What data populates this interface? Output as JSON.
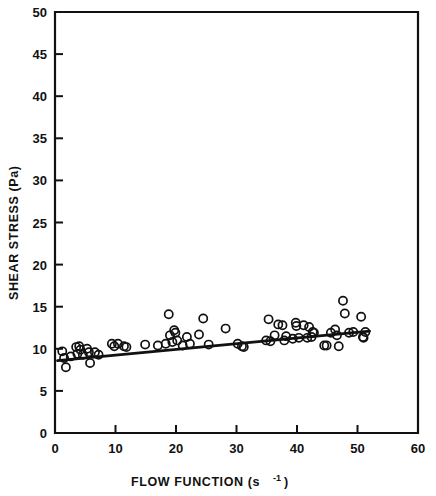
{
  "chart_data": {
    "type": "scatter",
    "title": "",
    "xlabel": "FLOW FUNCTION (s⁻¹)",
    "xlabel_base": "FLOW FUNCTION (s",
    "xlabel_exponent": "-1",
    "xlabel_suffix": ")",
    "ylabel": "SHEAR STRESS (Pa)",
    "xlim": [
      0,
      60
    ],
    "ylim": [
      0,
      50
    ],
    "xticks": [
      0,
      10,
      20,
      30,
      40,
      50,
      60
    ],
    "xtick_labels": [
      "0",
      "10",
      "20",
      "30",
      "40",
      "50",
      "60"
    ],
    "yticks": [
      0,
      5,
      10,
      15,
      20,
      25,
      30,
      35,
      40,
      45,
      50
    ],
    "ytick_labels": [
      "0",
      "5",
      "10",
      "15",
      "20",
      "25",
      "30",
      "35",
      "40",
      "45",
      "50"
    ],
    "grid": false,
    "legend": "none",
    "marker_style": "open-circle",
    "marker_color": "#111111",
    "line_color": "#111111",
    "series": [
      {
        "name": "Shear stress vs flow function",
        "points": [
          [
            1.2,
            9.7
          ],
          [
            1.5,
            8.9
          ],
          [
            1.8,
            7.8
          ],
          [
            2.6,
            9.1
          ],
          [
            3.5,
            10.2
          ],
          [
            3.7,
            9.4
          ],
          [
            4.0,
            10.3
          ],
          [
            4.2,
            9.9
          ],
          [
            4.6,
            9.3
          ],
          [
            5.3,
            10.0
          ],
          [
            5.6,
            9.6
          ],
          [
            5.8,
            8.3
          ],
          [
            6.6,
            9.6
          ],
          [
            7.2,
            9.3
          ],
          [
            9.4,
            10.6
          ],
          [
            9.8,
            10.3
          ],
          [
            10.4,
            10.6
          ],
          [
            11.4,
            10.3
          ],
          [
            11.8,
            10.2
          ],
          [
            14.9,
            10.5
          ],
          [
            17.0,
            10.4
          ],
          [
            18.3,
            10.6
          ],
          [
            18.8,
            14.1
          ],
          [
            19.0,
            11.6
          ],
          [
            19.4,
            10.8
          ],
          [
            19.7,
            12.2
          ],
          [
            19.9,
            11.9
          ],
          [
            20.2,
            11.0
          ],
          [
            21.1,
            10.4
          ],
          [
            21.8,
            11.4
          ],
          [
            22.3,
            10.6
          ],
          [
            23.8,
            11.7
          ],
          [
            24.5,
            13.6
          ],
          [
            25.4,
            10.5
          ],
          [
            28.2,
            12.4
          ],
          [
            30.2,
            10.6
          ],
          [
            30.9,
            10.3
          ],
          [
            31.2,
            10.2
          ],
          [
            34.9,
            11.0
          ],
          [
            35.3,
            13.5
          ],
          [
            35.6,
            10.9
          ],
          [
            36.3,
            11.6
          ],
          [
            36.9,
            12.9
          ],
          [
            37.6,
            12.8
          ],
          [
            37.9,
            11.0
          ],
          [
            38.2,
            11.5
          ],
          [
            39.3,
            11.2
          ],
          [
            39.8,
            13.1
          ],
          [
            39.9,
            12.7
          ],
          [
            40.3,
            11.3
          ],
          [
            41.1,
            12.8
          ],
          [
            41.7,
            11.3
          ],
          [
            42.0,
            12.6
          ],
          [
            42.4,
            11.4
          ],
          [
            42.6,
            12.0
          ],
          [
            42.8,
            11.9
          ],
          [
            44.5,
            10.4
          ],
          [
            44.9,
            10.4
          ],
          [
            45.6,
            11.9
          ],
          [
            46.3,
            12.3
          ],
          [
            46.6,
            11.6
          ],
          [
            46.9,
            10.3
          ],
          [
            47.6,
            15.7
          ],
          [
            47.9,
            14.2
          ],
          [
            48.6,
            11.9
          ],
          [
            49.3,
            12.0
          ],
          [
            50.6,
            13.8
          ],
          [
            50.9,
            11.4
          ],
          [
            51.0,
            11.3
          ],
          [
            51.3,
            12.0
          ]
        ]
      }
    ],
    "fit_line": {
      "name": "linear regression",
      "x_start": 0.4,
      "y_start": 8.6,
      "x_end": 52.0,
      "y_end": 12.1
    }
  }
}
